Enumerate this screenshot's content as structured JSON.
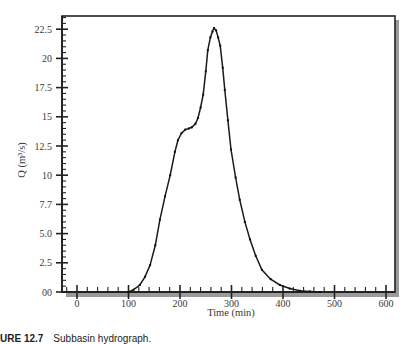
{
  "chart_data": {
    "type": "line",
    "title": "",
    "xlabel": "Time (min)",
    "ylabel": "Q (m³/s)",
    "xlim": [
      -30,
      620
    ],
    "ylim": [
      0,
      23.7
    ],
    "grid": false,
    "legend": null,
    "x_ticks": [
      "0",
      "100",
      "200",
      "300",
      "400",
      "500",
      "600"
    ],
    "x_tick_values": [
      0,
      100,
      200,
      300,
      400,
      500,
      600
    ],
    "y_ticks": [
      "00",
      "2.5",
      "5.0",
      "7.7",
      "10",
      "12.5",
      "15",
      "17.5",
      "20",
      "22.5"
    ],
    "y_tick_values": [
      0,
      2.5,
      5.0,
      7.5,
      10,
      12.5,
      15,
      17.5,
      20,
      22.5
    ],
    "series": [
      {
        "name": "Subbasin hydrograph",
        "x": [
          100,
          110,
          122,
          132,
          142,
          152,
          161,
          171,
          181,
          190,
          196,
          203,
          210,
          217,
          223,
          230,
          235,
          240,
          245,
          250,
          254,
          259,
          263,
          266,
          270,
          274,
          278,
          283,
          287,
          293,
          299,
          308,
          316,
          326,
          336,
          347,
          359,
          376,
          394,
          413,
          433,
          452,
          472
        ],
        "y": [
          0,
          0.2,
          0.6,
          1.3,
          2.3,
          4.0,
          6.2,
          8.2,
          10.0,
          12.0,
          13.0,
          13.6,
          13.9,
          14.0,
          14.1,
          14.4,
          14.9,
          15.8,
          16.9,
          18.9,
          20.7,
          21.8,
          22.3,
          22.6,
          22.4,
          21.8,
          21.1,
          19.2,
          17.3,
          14.7,
          12.2,
          9.8,
          7.9,
          6.0,
          4.5,
          3.1,
          1.9,
          1.1,
          0.6,
          0.3,
          0.1,
          0.05,
          0
        ]
      }
    ]
  },
  "caption": {
    "label": "URE 12.7",
    "text": "Subbasin hydrograph."
  }
}
